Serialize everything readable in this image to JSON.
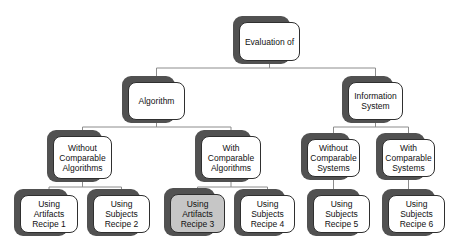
{
  "diagram": {
    "type": "tree",
    "nodes": {
      "root": {
        "lines": [
          "Evaluation of"
        ]
      },
      "algorithm": {
        "lines": [
          "Algorithm"
        ]
      },
      "information_system": {
        "lines": [
          "Information",
          "System"
        ]
      },
      "without_comparable_algorithms": {
        "lines": [
          "Without",
          "Comparable",
          "Algorithms"
        ]
      },
      "with_comparable_algorithms": {
        "lines": [
          "With",
          "Comparable",
          "Algorithms"
        ]
      },
      "without_comparable_systems": {
        "lines": [
          "Without",
          "Comparable",
          "Systems"
        ]
      },
      "with_comparable_systems": {
        "lines": [
          "With",
          "Comparable",
          "Systems"
        ]
      },
      "using_artifacts_recipe_1": {
        "lines": [
          "Using",
          "Artifacts",
          "Recipe 1"
        ]
      },
      "using_subjects_recipe_2": {
        "lines": [
          "Using",
          "Subjects",
          "Recipe 2"
        ]
      },
      "using_artifacts_recipe_3": {
        "lines": [
          "Using",
          "Artifacts",
          "Recipe 3"
        ],
        "highlighted": true
      },
      "using_subjects_recipe_4": {
        "lines": [
          "Using",
          "Subjects",
          "Recipe 4"
        ]
      },
      "using_subjects_recipe_5": {
        "lines": [
          "Using",
          "Subjects",
          "Recipe 5"
        ]
      },
      "using_subjects_recipe_6": {
        "lines": [
          "Using",
          "Subjects",
          "Recipe 6"
        ]
      }
    },
    "edges": [
      {
        "from": "root",
        "to": "algorithm"
      },
      {
        "from": "root",
        "to": "information_system"
      },
      {
        "from": "algorithm",
        "to": "without_comparable_algorithms"
      },
      {
        "from": "algorithm",
        "to": "with_comparable_algorithms"
      },
      {
        "from": "information_system",
        "to": "without_comparable_systems"
      },
      {
        "from": "information_system",
        "to": "with_comparable_systems"
      },
      {
        "from": "without_comparable_algorithms",
        "to": "using_artifacts_recipe_1"
      },
      {
        "from": "without_comparable_algorithms",
        "to": "using_subjects_recipe_2"
      },
      {
        "from": "with_comparable_algorithms",
        "to": "using_artifacts_recipe_3"
      },
      {
        "from": "with_comparable_algorithms",
        "to": "using_subjects_recipe_4"
      },
      {
        "from": "without_comparable_systems",
        "to": "using_subjects_recipe_5"
      },
      {
        "from": "with_comparable_systems",
        "to": "using_subjects_recipe_6"
      }
    ],
    "colors": {
      "background": "#ffffff",
      "shadow": "#515151",
      "box_fill": "#ffffff",
      "highlight_fill": "#c6c6c6",
      "border": "#2f2f2f",
      "connector": "#8c8c8c"
    }
  }
}
